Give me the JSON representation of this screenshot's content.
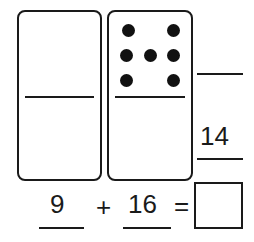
{
  "domino_left": {
    "top_dots": 0,
    "bottom_dots": 0
  },
  "domino_right": {
    "top_dots": 6,
    "bottom_dots": 0
  },
  "side_answers": {
    "top_blank": "",
    "bottom_value": "14"
  },
  "equation": {
    "addend1": "9",
    "operator": "+",
    "addend2": "16",
    "equals": "=",
    "answer": ""
  }
}
